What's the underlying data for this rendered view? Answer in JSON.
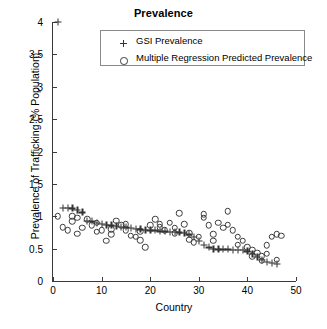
{
  "chart_data": {
    "type": "scatter",
    "title": "Prevalence",
    "xlabel": "Country",
    "ylabel": "Prevalence of Trafficking (% Population)",
    "xlim": [
      0,
      50
    ],
    "ylim": [
      0,
      4
    ],
    "xticks": [
      0,
      10,
      20,
      30,
      40,
      50
    ],
    "yticks": [
      0,
      0.5,
      1,
      1.5,
      2,
      2.5,
      3,
      3.5,
      4
    ],
    "ytick_labels": [
      "0",
      "0.5",
      "1",
      "1.5",
      "2",
      "2.5",
      "3",
      "3.5",
      "4"
    ],
    "xtick_labels": [
      "0",
      "10",
      "20",
      "30",
      "40",
      "50"
    ],
    "grid": false,
    "legend_position": "top-center",
    "series": [
      {
        "name": "GSI Prevalence",
        "marker": "plus",
        "color": "#333333",
        "x": [
          1,
          2,
          3,
          4,
          5,
          6,
          7,
          8,
          9,
          10,
          11,
          12,
          13,
          14,
          15,
          16,
          17,
          18,
          19,
          20,
          21,
          22,
          23,
          24,
          25,
          26,
          27,
          28,
          29,
          30,
          31,
          32,
          33,
          34,
          35,
          36,
          37,
          38,
          39,
          40,
          41,
          42,
          43,
          44,
          45,
          46
        ],
        "y": [
          4.0,
          1.13,
          1.13,
          1.12,
          1.1,
          1.06,
          0.93,
          0.92,
          0.9,
          0.88,
          0.87,
          0.86,
          0.85,
          0.84,
          0.83,
          0.82,
          0.81,
          0.8,
          0.79,
          0.78,
          0.78,
          0.77,
          0.77,
          0.76,
          0.76,
          0.75,
          0.74,
          0.72,
          0.68,
          0.62,
          0.56,
          0.52,
          0.5,
          0.49,
          0.49,
          0.49,
          0.48,
          0.48,
          0.48,
          0.46,
          0.42,
          0.37,
          0.33,
          0.3,
          0.28,
          0.27
        ]
      },
      {
        "name": "Multiple Regression Predicted Prevalence",
        "marker": "circle",
        "color": "#3b3b3b",
        "x": [
          1,
          2,
          3,
          4,
          4,
          5,
          6,
          7,
          8,
          9,
          10,
          11,
          12,
          13,
          14,
          15,
          16,
          17,
          18,
          19,
          20,
          21,
          22,
          23,
          24,
          25,
          26,
          27,
          28,
          29,
          30,
          31,
          32,
          33,
          34,
          35,
          36,
          37,
          38,
          39,
          40,
          41,
          42,
          43,
          44,
          45,
          46,
          47,
          5,
          12,
          18,
          22,
          28,
          33,
          38,
          41,
          44,
          46,
          9,
          15,
          25,
          31,
          36,
          43
        ],
        "y": [
          1.0,
          0.83,
          0.78,
          0.92,
          1.0,
          0.73,
          0.82,
          0.95,
          0.86,
          0.9,
          0.78,
          0.62,
          0.8,
          0.93,
          0.86,
          0.88,
          0.7,
          0.68,
          0.77,
          0.52,
          0.86,
          0.95,
          0.83,
          0.78,
          0.9,
          0.82,
          1.05,
          0.88,
          0.74,
          0.6,
          0.68,
          1.03,
          0.86,
          0.62,
          0.9,
          0.82,
          1.08,
          0.78,
          0.56,
          0.62,
          0.52,
          0.48,
          0.44,
          0.38,
          0.55,
          0.68,
          0.72,
          0.7,
          0.98,
          0.72,
          0.63,
          0.88,
          0.64,
          0.72,
          0.68,
          0.38,
          0.42,
          0.33,
          0.76,
          0.78,
          0.74,
          0.98,
          0.87,
          0.31
        ]
      }
    ]
  },
  "legend": {
    "entries": [
      {
        "label": "GSI Prevalence",
        "symbol": "plus-marker"
      },
      {
        "label": "Multiple Regression Predicted Prevalence",
        "symbol": "circle-marker"
      }
    ]
  }
}
